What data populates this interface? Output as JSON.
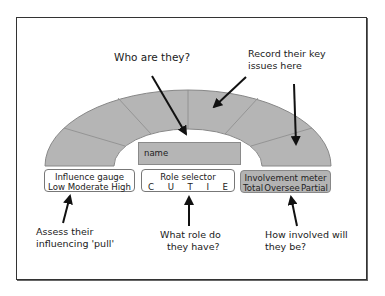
{
  "diagram": {
    "colors": {
      "arc_fill": "#b5b5b5",
      "arc_stroke": "#888888",
      "frame": "#333333",
      "arrow": "#111111"
    },
    "arc_segments": 6,
    "callouts": {
      "top_left": "Who are they?",
      "top_right_line1": "Record their key",
      "top_right_line2": "issues here",
      "bottom_left_line1": "Assess their",
      "bottom_left_line2": "influencing 'pull'",
      "bottom_middle_line1": "What role do",
      "bottom_middle_line2": "they have?",
      "bottom_right_line1": "How involved will",
      "bottom_right_line2": "they be?"
    },
    "name_field": {
      "placeholder": "name"
    },
    "influence_gauge": {
      "title": "Influence gauge",
      "options": [
        "Low",
        "Moderate",
        "High"
      ]
    },
    "role_selector": {
      "title": "Role selector",
      "options": [
        "C",
        "U",
        "T",
        "I",
        "E"
      ]
    },
    "involvement_meter": {
      "title": "Involvement meter",
      "options": [
        "Total",
        "Oversee",
        "Partial"
      ]
    }
  }
}
